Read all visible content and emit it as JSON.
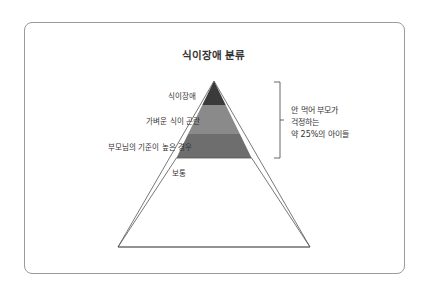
{
  "title": "식이장애 분류",
  "pyramid": {
    "levels": [
      {
        "label": "식이장애",
        "color": "#3a3a3a"
      },
      {
        "label": "가벼운 식이 곤란",
        "color": "#8a8a8a"
      },
      {
        "label": "부모님의 기준이 높은 경우",
        "color": "#6e6e6e"
      },
      {
        "label": "보통",
        "color": "#ffffff"
      }
    ]
  },
  "bracket_note": {
    "lines": [
      "안 먹어 부모가",
      "걱정하는",
      "약 25%의 아이들"
    ]
  }
}
